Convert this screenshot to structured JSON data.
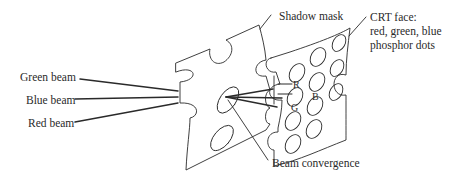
{
  "diagram": {
    "labels": {
      "green_beam": "Green beam",
      "blue_beam": "Blue beam",
      "red_beam": "Red beam",
      "shadow_mask": "Shadow mask",
      "crt_face_line1": "CRT face:",
      "crt_face_line2": "red, green, blue",
      "crt_face_line3": "phosphor dots",
      "beam_convergence": "Beam convergence"
    },
    "phosphor_dots": {
      "red": "R",
      "green": "G",
      "blue": "B"
    },
    "colors": {
      "line": "#2a2a2a",
      "background": "#ffffff"
    }
  }
}
